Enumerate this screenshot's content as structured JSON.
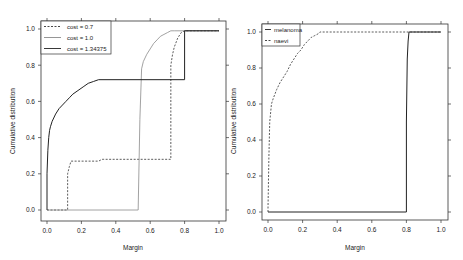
{
  "chart_data": [
    {
      "type": "line",
      "title": "",
      "xlabel": "Margin",
      "ylabel": "Cumulative distribution",
      "xlim": [
        0.0,
        1.0
      ],
      "ylim": [
        0.0,
        1.0
      ],
      "xticks": [
        "0.0",
        "0.2",
        "0.4",
        "0.6",
        "0.8",
        "1.0"
      ],
      "yticks": [
        "0.0",
        "0.2",
        "0.4",
        "0.6",
        "0.8",
        "1.0"
      ],
      "grid": false,
      "legend_position": "top-left",
      "series": [
        {
          "name": "cost = 0.7",
          "style": "dashed",
          "color": "#333333",
          "x": [
            0.0,
            0.12,
            0.12,
            0.13,
            0.14,
            0.3,
            0.32,
            0.33,
            0.72,
            0.72,
            0.73,
            0.74,
            0.76,
            0.78,
            0.8,
            1.0
          ],
          "y": [
            0.0,
            0.0,
            0.2,
            0.24,
            0.27,
            0.27,
            0.28,
            0.28,
            0.28,
            0.8,
            0.86,
            0.9,
            0.95,
            0.98,
            0.99,
            0.99
          ]
        },
        {
          "name": "cost = 1.0",
          "style": "solid-thin",
          "color": "#8a8a8a",
          "x": [
            0.0,
            0.53,
            0.54,
            0.55,
            0.56,
            0.58,
            0.6,
            0.62,
            0.64,
            0.66,
            0.68,
            0.7,
            0.72,
            0.74,
            0.8,
            1.0
          ],
          "y": [
            0.0,
            0.0,
            0.5,
            0.78,
            0.82,
            0.86,
            0.89,
            0.92,
            0.94,
            0.96,
            0.97,
            0.98,
            0.99,
            0.99,
            0.99,
            0.99
          ]
        },
        {
          "name": "cost = 1.34375",
          "style": "solid",
          "color": "#222222",
          "x": [
            0.0,
            0.0,
            0.005,
            0.01,
            0.015,
            0.02,
            0.03,
            0.05,
            0.07,
            0.09,
            0.11,
            0.13,
            0.15,
            0.18,
            0.21,
            0.24,
            0.27,
            0.3,
            0.8,
            0.8,
            1.0
          ],
          "y": [
            0.0,
            0.2,
            0.33,
            0.4,
            0.44,
            0.46,
            0.49,
            0.53,
            0.56,
            0.58,
            0.6,
            0.62,
            0.64,
            0.66,
            0.68,
            0.7,
            0.71,
            0.72,
            0.72,
            0.99,
            0.99
          ]
        }
      ]
    },
    {
      "type": "line",
      "title": "",
      "xlabel": "Margin",
      "ylabel": "Cumulative distribution",
      "xlim": [
        0.0,
        1.0
      ],
      "ylim": [
        0.0,
        1.0
      ],
      "xticks": [
        "0.0",
        "0.2",
        "0.4",
        "0.6",
        "0.8",
        "1.0"
      ],
      "yticks": [
        "0.0",
        "0.2",
        "0.4",
        "0.6",
        "0.8",
        "1.0"
      ],
      "grid": false,
      "legend_position": "top-left",
      "series": [
        {
          "name": "melanoma",
          "style": "solid",
          "color": "#222222",
          "x": [
            0.0,
            0.8,
            0.8,
            0.805,
            0.81,
            0.815,
            1.0
          ],
          "y": [
            0.0,
            0.0,
            0.5,
            0.85,
            0.95,
            1.0,
            1.0
          ]
        },
        {
          "name": "naevi",
          "style": "dashed",
          "color": "#333333",
          "x": [
            0.0,
            0.0,
            0.005,
            0.01,
            0.02,
            0.03,
            0.05,
            0.07,
            0.09,
            0.11,
            0.13,
            0.15,
            0.17,
            0.19,
            0.21,
            0.23,
            0.25,
            0.27,
            0.29,
            0.3,
            1.0
          ],
          "y": [
            0.0,
            0.02,
            0.3,
            0.5,
            0.6,
            0.63,
            0.68,
            0.72,
            0.75,
            0.78,
            0.82,
            0.85,
            0.88,
            0.9,
            0.93,
            0.95,
            0.97,
            0.98,
            0.99,
            1.0,
            1.0
          ]
        }
      ]
    }
  ],
  "plots": [
    {
      "xlabel": "Margin",
      "ylabel": "Cumulative distribution",
      "legend": [
        "cost = 0.7",
        "cost = 1.0",
        "cost = 1.34375"
      ]
    },
    {
      "xlabel": "Margin",
      "ylabel": "Cumulative distribution",
      "legend": [
        "melanoma",
        "naevi"
      ]
    }
  ]
}
